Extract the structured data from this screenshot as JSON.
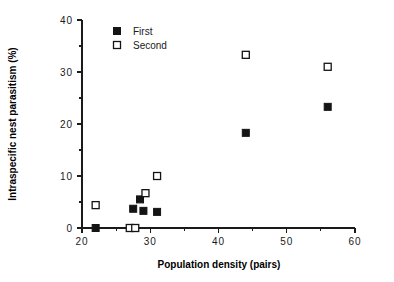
{
  "chart_data": {
    "type": "scatter",
    "title": "",
    "xlabel": "Population density (pairs)",
    "ylabel": "Intraspecific nest parasitism (%)",
    "xlim": [
      20,
      60
    ],
    "ylim": [
      0,
      40
    ],
    "xticks": [
      20,
      30,
      40,
      50,
      60
    ],
    "xtick_labels": [
      "20",
      "30",
      "40",
      "50",
      "60"
    ],
    "xminor_ticks": [
      25,
      35,
      45,
      55
    ],
    "yticks": [
      0,
      10,
      20,
      30,
      40
    ],
    "ytick_labels": [
      "0",
      "10",
      "20",
      "30",
      "40"
    ],
    "yminor_ticks": [
      5,
      15,
      25,
      35
    ],
    "grid": false,
    "legend_position": "top-left",
    "series": [
      {
        "name": "First",
        "marker": "filled-square",
        "color": "#141414",
        "points": [
          {
            "x": 22.0,
            "y": 0.0
          },
          {
            "x": 27.5,
            "y": 3.7
          },
          {
            "x": 28.5,
            "y": 5.5
          },
          {
            "x": 29.0,
            "y": 3.3
          },
          {
            "x": 31.0,
            "y": 3.1
          },
          {
            "x": 44.0,
            "y": 18.3
          },
          {
            "x": 56.0,
            "y": 23.3
          }
        ]
      },
      {
        "name": "Second",
        "marker": "open-square",
        "color": "#141414",
        "points": [
          {
            "x": 22.0,
            "y": 4.4
          },
          {
            "x": 27.0,
            "y": 0.0
          },
          {
            "x": 27.8,
            "y": 0.0
          },
          {
            "x": 29.3,
            "y": 6.7
          },
          {
            "x": 31.0,
            "y": 10.0
          },
          {
            "x": 44.0,
            "y": 33.3
          },
          {
            "x": 56.0,
            "y": 31.0
          }
        ]
      }
    ]
  },
  "legend": {
    "entries": [
      {
        "label": "First",
        "marker": "filled-square"
      },
      {
        "label": "Second",
        "marker": "open-square"
      }
    ]
  },
  "axes": {
    "x_title": "Population density (pairs)",
    "y_title": "Intraspecific nest parasitism (%)"
  },
  "colors": {
    "ink": "#141414",
    "background": "#ffffff"
  }
}
